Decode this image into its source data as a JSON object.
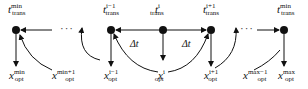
{
  "diagram": {
    "nodes": [
      {
        "id": "tmin",
        "base": "t",
        "sub": "trans",
        "sup": "min",
        "x": 47,
        "y": 32
      },
      {
        "id": "tim1",
        "base": "t",
        "sub": "trans",
        "sup": "i−1",
        "x": 111,
        "y": 32
      },
      {
        "id": "ti",
        "base": "t",
        "sub": "trans",
        "sup": "i",
        "x": 163,
        "y": 32
      },
      {
        "id": "tip1",
        "base": "t",
        "sub": "trans",
        "sup": "i+1",
        "x": 209,
        "y": 32
      },
      {
        "id": "tmax",
        "base": "t",
        "sub": "trans",
        "sup": "min",
        "x": 273,
        "y": 32
      }
    ],
    "outputs": [
      {
        "id": "xmin",
        "base": "x",
        "sub": "opt",
        "sup": "min"
      },
      {
        "id": "xmin1",
        "base": "x",
        "sub": "opt",
        "sup": "min+1"
      },
      {
        "id": "xim1",
        "base": "x",
        "sub": "opt",
        "sup": "i−1"
      },
      {
        "id": "xi",
        "base": "x",
        "sub": "opt",
        "sup": "i"
      },
      {
        "id": "xip1",
        "base": "x",
        "sub": "opt",
        "sup": "i+1"
      },
      {
        "id": "xmaxm1",
        "base": "x",
        "sub": "opt",
        "sup": "max−1"
      },
      {
        "id": "xmax",
        "base": "x",
        "sub": "opt",
        "sup": "max"
      }
    ],
    "delta_label": "Δt",
    "ellipsis": "···"
  }
}
